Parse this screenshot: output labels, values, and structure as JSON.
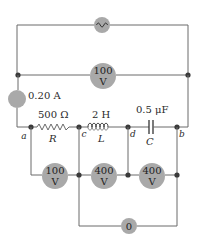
{
  "diagram": {
    "type": "AC series RLC circuit with meters",
    "source": {
      "icon": "ac-source-icon",
      "symbol": "~"
    },
    "meters": {
      "total_voltage": {
        "value": "100",
        "unit": "V"
      },
      "ammeter": {
        "label": "0.20 A"
      },
      "resistor_voltage": {
        "value": "100",
        "unit": "V"
      },
      "inductor_voltage": {
        "value": "400",
        "unit": "V"
      },
      "capacitor_voltage": {
        "value": "400",
        "unit": "V"
      },
      "lc_voltage": {
        "value": "0"
      }
    },
    "components": {
      "resistor": {
        "value": "500 Ω",
        "symbol": "R"
      },
      "inductor": {
        "value": "2 H",
        "symbol": "L"
      },
      "capacitor": {
        "value": "0.5 μF",
        "symbol": "C"
      }
    },
    "nodes": {
      "a": "a",
      "b": "b",
      "c": "c",
      "d": "d"
    },
    "colors": {
      "meter_fill": "#a9a9a9",
      "wire": "#6a6a6a",
      "node_dot": "#3a3a3a"
    }
  }
}
